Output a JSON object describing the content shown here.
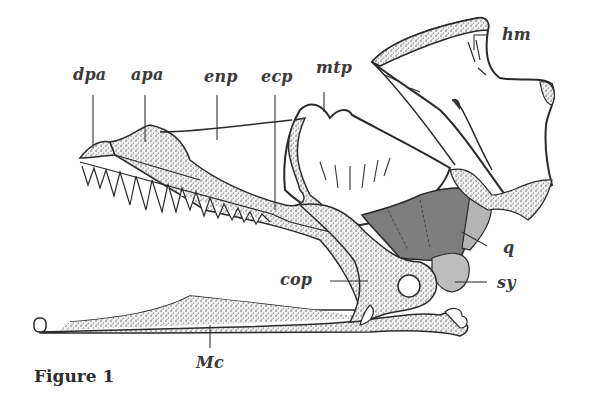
{
  "figure": {
    "caption": "Figure 1",
    "labels": {
      "dpa": "dpa",
      "apa": "apa",
      "enp": "enp",
      "ecp": "ecp",
      "mtp": "mtp",
      "hm": "hm",
      "q": "q",
      "sy": "sy",
      "cop": "cop",
      "Mc": "Mc"
    },
    "colors": {
      "outline": "#2a2a2a",
      "stipple": "#5a5a5a",
      "quadrate_dark": "#7d7d7d",
      "quadrate_light": "#b4b4b4",
      "symplectic": "#bdbdbd",
      "label_text": "#3a3a3a"
    }
  }
}
